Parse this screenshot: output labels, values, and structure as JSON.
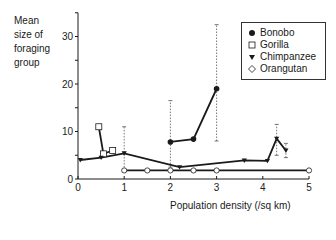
{
  "chart_data": {
    "type": "line",
    "title": "",
    "ylabel": "Mean size of foraging group",
    "ylabel_lines": [
      "Mean",
      "size of",
      "foraging",
      "group"
    ],
    "xlabel": "Population density (/sq km)",
    "xlim": [
      0,
      5
    ],
    "ylim": [
      0,
      35
    ],
    "xticks": [
      0,
      1,
      2,
      3,
      4,
      5
    ],
    "yticks": [
      0,
      10,
      20,
      30
    ],
    "grid": false,
    "legend_position": "upper right",
    "series": [
      {
        "name": "Bonobo",
        "marker": "filled-circle",
        "points": [
          [
            2.0,
            7.8
          ],
          [
            2.5,
            8.4
          ],
          [
            3.0,
            19.0
          ]
        ],
        "error_bars": [
          {
            "x": 2.0,
            "low": 2.5,
            "high": 16.5
          },
          {
            "x": 3.0,
            "low": 8.0,
            "high": 32.5
          }
        ]
      },
      {
        "name": "Gorilla",
        "marker": "open-square",
        "points": [
          [
            0.45,
            11.0
          ],
          [
            0.55,
            5.3
          ],
          [
            0.75,
            6.0
          ]
        ],
        "error_bars": []
      },
      {
        "name": "Chimpanzee",
        "marker": "filled-triangle-down",
        "points": [
          [
            0.05,
            4.0
          ],
          [
            0.5,
            4.5
          ],
          [
            1.0,
            5.4
          ],
          [
            2.2,
            2.5
          ],
          [
            3.6,
            3.9
          ],
          [
            4.1,
            3.8
          ],
          [
            4.3,
            8.5
          ],
          [
            4.5,
            6.0
          ]
        ],
        "error_bars": [
          {
            "x": 1.0,
            "low": 1.8,
            "high": 11.0
          },
          {
            "x": 4.3,
            "low": 5.0,
            "high": 11.5
          },
          {
            "x": 4.5,
            "low": 4.5,
            "high": 7.5
          }
        ]
      },
      {
        "name": "Orangutan",
        "marker": "open-diamond",
        "points": [
          [
            1.0,
            1.8
          ],
          [
            1.5,
            1.8
          ],
          [
            2.0,
            1.8
          ],
          [
            2.5,
            1.8
          ],
          [
            3.0,
            1.8
          ],
          [
            5.0,
            1.8
          ]
        ],
        "error_bars": []
      }
    ]
  },
  "legend": {
    "items": [
      {
        "label": "Bonobo",
        "symbol": "filled-circle"
      },
      {
        "label": "Gorilla",
        "symbol": "open-square"
      },
      {
        "label": "Chimpanzee",
        "symbol": "filled-triangle-down"
      },
      {
        "label": "Orangutan",
        "symbol": "open-diamond"
      }
    ]
  },
  "axes": {
    "y_label_lines": [
      "Mean",
      "size of",
      "foraging",
      "group"
    ],
    "x_label": "Population density (/sq km)",
    "x_tick_labels": [
      "0",
      "1",
      "2",
      "3",
      "4",
      "5"
    ],
    "y_tick_labels": [
      "0",
      "10",
      "20",
      "30"
    ]
  },
  "colors": {
    "line": "#1a1a1a",
    "errorbar": "#555555",
    "background": "#ffffff"
  }
}
